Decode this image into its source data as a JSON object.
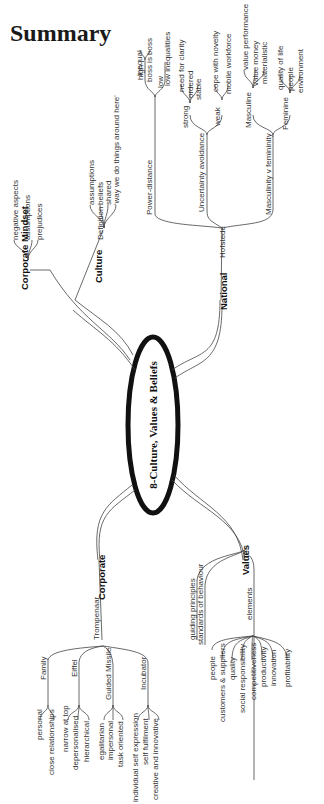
{
  "page": {
    "title": "Summary"
  },
  "mindmap": {
    "center": "8-Culture, Values & Beliefs",
    "branches": {
      "corporate_mindset": {
        "label": "Corporate Mindset",
        "children": [
          "negative aspects",
          "assumptions",
          "prejudices"
        ]
      },
      "culture": {
        "label": "Culture",
        "definition": "Definition",
        "children": [
          "assumptions",
          "beliefs",
          "shared",
          "'way we do things around here'"
        ]
      },
      "national": {
        "label": "National",
        "hofstede": "Hofstede",
        "power_distance": {
          "label": "Power-distance",
          "high": "high",
          "high_children": [
            "inequal",
            "boss is boss"
          ],
          "low": "low",
          "low_children": [
            "low inequalities"
          ]
        },
        "uncertainty": {
          "label": "Uncertainty avoidance",
          "strong": "strong",
          "strong_children": [
            "need for clarity",
            "ordered",
            "stable"
          ],
          "weak": "weak",
          "weak_children": [
            "cope with novelty",
            "mobile workforce"
          ]
        },
        "masculinity": {
          "label": "Masculinity v femininity",
          "masculine": "Masculine",
          "masculine_children": [
            "value performance",
            "value money",
            "materialistic"
          ],
          "feminine": "Feminine",
          "feminine_children": [
            "quality of life",
            "people",
            "environment"
          ]
        }
      },
      "values": {
        "label": "Values",
        "children": [
          "guiding principles",
          "standards of behaviour"
        ],
        "elements": "elements",
        "element_children": [
          "people",
          "customers & suppliers",
          "quality",
          "social responsibility",
          "competitiveness",
          "productivity",
          "innovation",
          "profitability"
        ]
      },
      "corporate": {
        "label": "Corporate",
        "trompenaar": "Trompenaar",
        "family": {
          "label": "Family",
          "children": [
            "personal",
            "close relationships"
          ]
        },
        "eiffel": {
          "label": "Eiffel",
          "children": [
            "narrow at top",
            "depersonalised",
            "hierarchical"
          ]
        },
        "guided_missile": {
          "label": "Guided Missile",
          "children": [
            "egalitarian",
            "impersonal",
            "task oriented"
          ]
        },
        "incubator": {
          "label": "Incubator",
          "children": [
            "individual self expression",
            "self fulfilment",
            "creative and innovative"
          ]
        }
      }
    }
  }
}
